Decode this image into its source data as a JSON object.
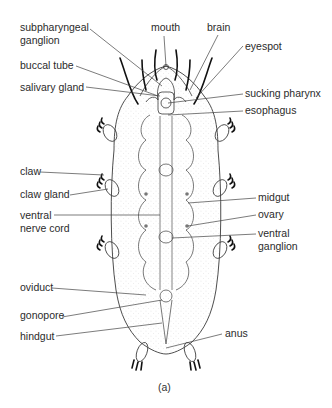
{
  "figure": {
    "caption": "(a)",
    "labels_left": [
      {
        "id": "subpharyngeal-ganglion",
        "line1": "subpharyngeal",
        "line2": "ganglion"
      },
      {
        "id": "buccal-tube",
        "line1": "buccal tube"
      },
      {
        "id": "salivary-gland",
        "line1": "salivary gland"
      },
      {
        "id": "claw",
        "line1": "claw"
      },
      {
        "id": "claw-gland",
        "line1": "claw gland"
      },
      {
        "id": "ventral-nerve-cord",
        "line1": "ventral",
        "line2": "nerve cord"
      },
      {
        "id": "oviduct",
        "line1": "oviduct"
      },
      {
        "id": "gonopore",
        "line1": "gonopore"
      },
      {
        "id": "hindgut",
        "line1": "hindgut"
      }
    ],
    "labels_top": [
      {
        "id": "mouth",
        "line1": "mouth"
      },
      {
        "id": "brain",
        "line1": "brain"
      }
    ],
    "labels_right": [
      {
        "id": "eyespot",
        "line1": "eyespot"
      },
      {
        "id": "sucking-pharynx",
        "line1": "sucking pharynx"
      },
      {
        "id": "esophagus",
        "line1": "esophagus"
      },
      {
        "id": "midgut",
        "line1": "midgut"
      },
      {
        "id": "ovary",
        "line1": "ovary"
      },
      {
        "id": "ventral-ganglion",
        "line1": "ventral",
        "line2": "ganglion"
      },
      {
        "id": "anus",
        "line1": "anus"
      }
    ],
    "colors": {
      "line": "#3a3a3a",
      "label": "#2b2b2b",
      "stipple": "#9a9a9a"
    }
  }
}
